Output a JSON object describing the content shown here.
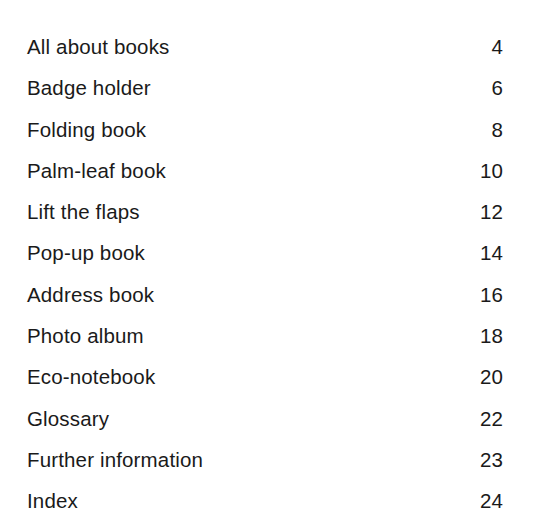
{
  "page": {
    "kind": "table-of-contents",
    "background_color": "#ffffff",
    "text_color": "#1a1a1a"
  },
  "toc": {
    "entries": [
      {
        "title": "All about books",
        "page": "4"
      },
      {
        "title": "Badge holder",
        "page": "6"
      },
      {
        "title": "Folding book",
        "page": "8"
      },
      {
        "title": "Palm-leaf book",
        "page": "10"
      },
      {
        "title": "Lift the flaps",
        "page": "12"
      },
      {
        "title": "Pop-up book",
        "page": "14"
      },
      {
        "title": "Address book",
        "page": "16"
      },
      {
        "title": "Photo album",
        "page": "18"
      },
      {
        "title": "Eco-notebook",
        "page": "20"
      },
      {
        "title": "Glossary",
        "page": "22"
      },
      {
        "title": "Further information",
        "page": "23"
      },
      {
        "title": "Index",
        "page": "24"
      }
    ]
  }
}
